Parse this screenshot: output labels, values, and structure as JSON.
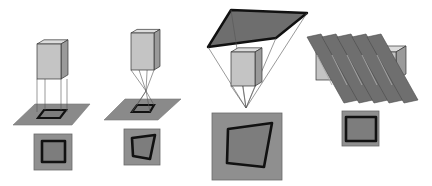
{
  "diagram": {
    "colors": {
      "background": "#ffffff",
      "plane_fill": "#8a8a8a",
      "image_fill": "#8f8f8f",
      "inner_fill": "#7d7d7d",
      "outline": "#111111",
      "box_front": "#c4c4c4",
      "box_top": "#dcdcdc",
      "box_side": "#9a9a9a",
      "ray": "#555555",
      "slice_fill": "#6f6f6f"
    },
    "panels": [
      {
        "name": "orthographic",
        "box": {
          "x": 37,
          "y": 44,
          "w": 24,
          "h": 35,
          "depth": 7
        },
        "plane": "13,125 35,104 90,104 72,125",
        "footprint": "38,118 44,110 66,110 60,118",
        "image": {
          "x": 34,
          "y": 134,
          "w": 38,
          "h": 36
        },
        "image_inner": "42,141 65,141 65,162 42,162"
      },
      {
        "name": "perspective-pinhole",
        "box": {
          "x": 131,
          "y": 33,
          "w": 23,
          "h": 37,
          "depth": 6
        },
        "plane": "104,120 125,99 181,99 158,120",
        "focal_point": {
          "x": 146,
          "y": 91
        },
        "footprint": "132,112 137,105 154,105 150,112",
        "image": {
          "x": 124,
          "y": 129,
          "w": 36,
          "h": 36
        },
        "image_inner": "132,138 155,135 150,159 133,156"
      },
      {
        "name": "perspective-wide",
        "image_plane": "208,47 231,10 307,13 276,38",
        "box": {
          "x": 231,
          "y": 52,
          "w": 24,
          "h": 34,
          "depth": 7
        },
        "focal_point": {
          "x": 246,
          "y": 108
        },
        "image": {
          "x": 212,
          "y": 113,
          "w": 70,
          "h": 67
        },
        "image_inner": "228,129 272,123 264,167 227,163"
      },
      {
        "name": "pushbroom",
        "box": {
          "x": 316,
          "y": 52,
          "w": 80,
          "h": 28,
          "depth": 10
        },
        "slice_count": 5,
        "slice_spacing": 15,
        "slice_first": "307,37 321,34 358,100 344,103",
        "image": {
          "x": 342,
          "y": 111,
          "w": 37,
          "h": 35
        },
        "image_inner": "346,117 376,117 376,141 346,141"
      }
    ]
  }
}
